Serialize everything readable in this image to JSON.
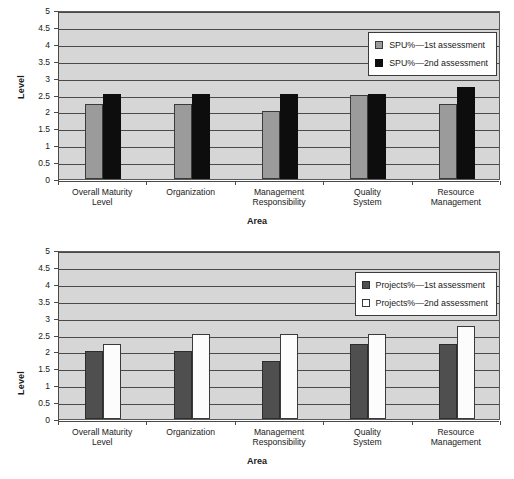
{
  "charts": [
    {
      "id": "spu-chart",
      "ylabel": "Level",
      "xlabel": "Area",
      "yticks": [
        "5",
        "4.5",
        "4",
        "3.5",
        "3",
        "2.5",
        "2",
        "1.5",
        "1",
        "0.5",
        "0"
      ],
      "categories": [
        "Overall Maturity\nLevel",
        "Organization",
        "Management\nResponsibility",
        "Quality\nSystem",
        "Resource\nManagement"
      ],
      "legend": [
        {
          "label": "SPU%—1st assessment",
          "style": "s-gray",
          "color": "#9b9b9b"
        },
        {
          "label": "SPU%—2nd assessment",
          "style": "s-black",
          "color": "#0d0d0d"
        }
      ],
      "chart_data": {
        "type": "bar",
        "title": "",
        "xlabel": "Area",
        "ylabel": "Level",
        "ylim": [
          0,
          5
        ],
        "ytick_step": 0.5,
        "grid": true,
        "legend_position": "top-right",
        "categories": [
          "Overall Maturity Level",
          "Organization",
          "Management Responsibility",
          "Quality System",
          "Resource Management"
        ],
        "series": [
          {
            "name": "SPU%—1st assessment",
            "color": "#9b9b9b",
            "values": [
              2.22,
              2.22,
              2.0,
              2.48,
              2.22
            ]
          },
          {
            "name": "SPU%—2nd assessment",
            "color": "#0d0d0d",
            "values": [
              2.5,
              2.5,
              2.5,
              2.5,
              2.72
            ]
          }
        ]
      }
    },
    {
      "id": "projects-chart",
      "ylabel": "Level",
      "xlabel": "Area",
      "yticks": [
        "5",
        "4.5",
        "4",
        "3.5",
        "3",
        "2.5",
        "2",
        "1.5",
        "1",
        "0.5",
        "0"
      ],
      "categories": [
        "Overall Maturity\nLevel",
        "Organization",
        "Management\nResponsibility",
        "Quality\nSystem",
        "Resource\nManagement"
      ],
      "legend": [
        {
          "label": "Projects%—1st assessment",
          "style": "s-darkgray",
          "color": "#4f4f4f"
        },
        {
          "label": "Projects%—2nd assessment",
          "style": "s-white",
          "color": "#ffffff"
        }
      ],
      "chart_data": {
        "type": "bar",
        "title": "",
        "xlabel": "Area",
        "ylabel": "Level",
        "ylim": [
          0,
          5
        ],
        "ytick_step": 0.5,
        "grid": true,
        "legend_position": "top-right",
        "categories": [
          "Overall Maturity Level",
          "Organization",
          "Management Responsibility",
          "Quality System",
          "Resource Management"
        ],
        "series": [
          {
            "name": "Projects%—1st assessment",
            "color": "#4f4f4f",
            "values": [
              2.0,
              2.0,
              1.72,
              2.22,
              2.22
            ]
          },
          {
            "name": "Projects%—2nd assessment",
            "color": "#ffffff",
            "values": [
              2.22,
              2.5,
              2.5,
              2.5,
              2.75
            ]
          }
        ]
      }
    }
  ]
}
